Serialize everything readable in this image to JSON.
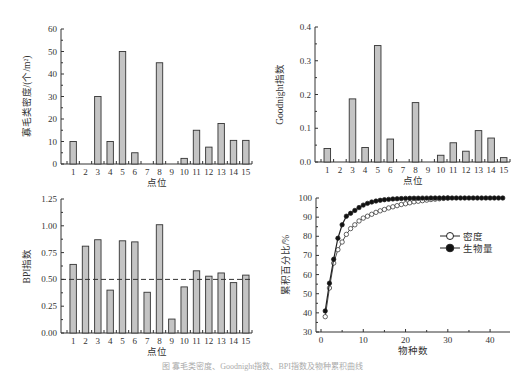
{
  "chart_data": [
    {
      "type": "bar",
      "id": "density",
      "categories": [
        "1",
        "2",
        "3",
        "4",
        "5",
        "6",
        "7",
        "8",
        "9",
        "10",
        "11",
        "12",
        "13",
        "14",
        "15"
      ],
      "values": [
        10,
        0,
        30,
        10,
        50,
        5,
        0,
        45,
        0,
        2.5,
        15,
        7.5,
        18,
        10.5,
        10.5
      ],
      "title": "",
      "xlabel": "点位",
      "ylabel": "寡毛类密度/(个/m²)",
      "ylim": [
        0,
        60
      ],
      "yticks": [
        0,
        10,
        20,
        30,
        40,
        50,
        60
      ],
      "grid": false
    },
    {
      "type": "bar",
      "id": "goodnight",
      "categories": [
        "1",
        "2",
        "3",
        "4",
        "5",
        "6",
        "7",
        "8",
        "9",
        "10",
        "11",
        "12",
        "13",
        "14",
        "15"
      ],
      "values": [
        0.04,
        0,
        0.187,
        0.043,
        0.345,
        0.068,
        0,
        0.176,
        0,
        0.02,
        0.057,
        0.032,
        0.093,
        0.071,
        0.013
      ],
      "title": "",
      "xlabel": "点位",
      "ylabel": "Goodnight指数",
      "ylim": [
        0,
        0.4
      ],
      "yticks": [
        "0.0",
        "0.1",
        "0.2",
        "0.3",
        "0.4"
      ],
      "grid": false
    },
    {
      "type": "bar",
      "id": "bpi",
      "categories": [
        "1",
        "2",
        "3",
        "4",
        "5",
        "6",
        "7",
        "8",
        "9",
        "10",
        "11",
        "12",
        "13",
        "14",
        "15"
      ],
      "values": [
        0.64,
        0.81,
        0.87,
        0.4,
        0.86,
        0.85,
        0.38,
        1.01,
        0.13,
        0.43,
        0.58,
        0.53,
        0.56,
        0.47,
        0.54
      ],
      "title": "",
      "xlabel": "点位",
      "ylabel": "BPI指数",
      "ylim": [
        0,
        1.25
      ],
      "yticks": [
        "0.00",
        "0.25",
        "0.50",
        "0.75",
        "1.00",
        "1.25"
      ],
      "reference_line": {
        "y": 0.5,
        "style": "dashed"
      },
      "grid": false
    },
    {
      "type": "line",
      "id": "cumulative",
      "xlabel": "物种数",
      "ylabel": "累积百分比/%",
      "xlim": [
        0,
        44
      ],
      "ylim": [
        30,
        100
      ],
      "xticks": [
        0,
        10,
        20,
        30,
        40
      ],
      "yticks": [
        30,
        40,
        50,
        60,
        70,
        80,
        90,
        100
      ],
      "legend_position": "right-middle",
      "series": [
        {
          "name": "密度",
          "marker": "open-circle",
          "x": [
            1,
            2,
            3,
            4,
            5,
            6,
            7,
            8,
            9,
            10,
            11,
            12,
            13,
            14,
            15,
            16,
            17,
            18,
            19,
            20,
            21,
            22,
            23,
            24,
            25,
            26,
            27,
            28,
            29,
            30
          ],
          "values": [
            38,
            53,
            66,
            73,
            77,
            81,
            84,
            86,
            88,
            89.5,
            90.5,
            91.5,
            92.5,
            93.3,
            94,
            94.8,
            95.4,
            96,
            96.6,
            97,
            97.5,
            98,
            98.3,
            98.6,
            98.9,
            99.2,
            99.4,
            99.6,
            99.8,
            100
          ]
        },
        {
          "name": "生物量",
          "marker": "filled-circle",
          "x": [
            1,
            2,
            3,
            4,
            5,
            6,
            7,
            8,
            9,
            10,
            11,
            12,
            13,
            14,
            15,
            16,
            17,
            18,
            19,
            20,
            21,
            22,
            23,
            24,
            25,
            26,
            27,
            28,
            29,
            30,
            31,
            32,
            33,
            34,
            35,
            36,
            37,
            38,
            39,
            40,
            41,
            42,
            43
          ],
          "values": [
            41,
            55.5,
            68,
            79,
            86,
            90.5,
            92,
            93.5,
            95,
            96.3,
            97.2,
            97.9,
            98.4,
            98.8,
            99.1,
            99.3,
            99.5,
            99.6,
            99.7,
            99.8,
            99.85,
            99.9,
            99.9,
            99.95,
            99.95,
            100,
            100,
            100,
            100,
            100,
            100,
            100,
            100,
            100,
            100,
            100,
            100,
            100,
            100,
            100,
            100,
            100,
            100
          ]
        }
      ]
    }
  ],
  "caption": "图  寡毛类密度、Goodnight指数、BPI指数及物种累积曲线"
}
